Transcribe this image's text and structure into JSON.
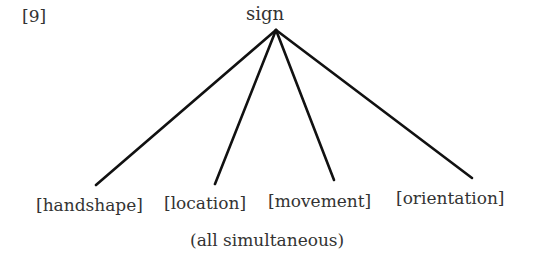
{
  "example_number": "[9]",
  "root": "sign",
  "children": [
    "[handshape]",
    "[location]",
    "[movement]",
    "[orientation]"
  ],
  "caption": "(all simultaneous)",
  "colors": {
    "line": "#111111",
    "text": "#333333"
  }
}
